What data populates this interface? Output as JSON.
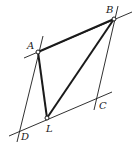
{
  "diagram": {
    "type": "geometry-figure",
    "colors": {
      "stroke": "#1a1a1a",
      "background": "#ffffff"
    },
    "points": [
      {
        "label": "A",
        "x": 38,
        "y": 52
      },
      {
        "label": "B",
        "x": 114,
        "y": 19
      },
      {
        "label": "C",
        "x": 97,
        "y": 98
      },
      {
        "label": "D",
        "x": 20,
        "y": 130
      },
      {
        "label": "L",
        "x": 47,
        "y": 118
      }
    ],
    "thin_lines": [
      {
        "name": "line-AB-extended",
        "from": [
          24,
          58
        ],
        "to": [
          132,
          12
        ]
      },
      {
        "name": "line-DC-extended",
        "from": [
          9,
          136
        ],
        "to": [
          112,
          92
        ]
      },
      {
        "name": "line-AD-extended",
        "from": [
          43,
          36
        ],
        "to": [
          17,
          142
        ]
      },
      {
        "name": "line-BC-extended",
        "from": [
          118,
          6
        ],
        "to": [
          94,
          110
        ]
      }
    ],
    "thick_segments": [
      {
        "name": "segment-AB",
        "from": "A",
        "to": "B"
      },
      {
        "name": "segment-AL",
        "from": "A",
        "to": "L"
      },
      {
        "name": "segment-BL",
        "from": "B",
        "to": "L"
      }
    ],
    "labels": {
      "A": "A",
      "B": "B",
      "C": "C",
      "D": "D",
      "L": "L"
    }
  }
}
